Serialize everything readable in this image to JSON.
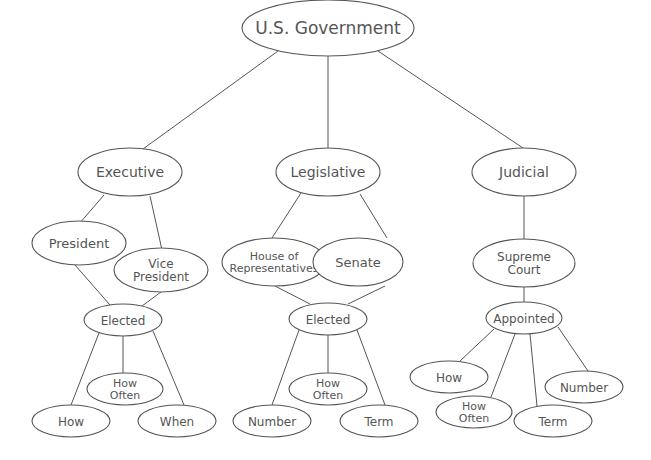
{
  "diagram": {
    "title": "U.S. Government",
    "colors": {
      "stroke": "#555555",
      "text": "#555555",
      "background": "#ffffff"
    },
    "nodes": [
      {
        "id": "gov",
        "lines": [
          "U.S. Government"
        ],
        "cx": 328,
        "cy": 28,
        "rx": 86,
        "ry": 28,
        "size": 17
      },
      {
        "id": "exec",
        "lines": [
          "Executive"
        ],
        "cx": 130,
        "cy": 172,
        "rx": 52,
        "ry": 24,
        "size": 14
      },
      {
        "id": "leg",
        "lines": [
          "Legislative"
        ],
        "cx": 328,
        "cy": 172,
        "rx": 52,
        "ry": 24,
        "size": 14
      },
      {
        "id": "jud",
        "lines": [
          "Judicial"
        ],
        "cx": 524,
        "cy": 172,
        "rx": 52,
        "ry": 24,
        "size": 14
      },
      {
        "id": "pres",
        "lines": [
          "President"
        ],
        "cx": 79,
        "cy": 243,
        "rx": 47,
        "ry": 22,
        "size": 13
      },
      {
        "id": "vp",
        "lines": [
          "Vice",
          "President"
        ],
        "cx": 161,
        "cy": 270,
        "rx": 47,
        "ry": 22,
        "size": 12
      },
      {
        "id": "exec_elected",
        "lines": [
          "Elected"
        ],
        "cx": 123,
        "cy": 320,
        "rx": 39,
        "ry": 16,
        "size": 12
      },
      {
        "id": "exec_howoften",
        "lines": [
          "How",
          "Often"
        ],
        "cx": 125,
        "cy": 389,
        "rx": 38,
        "ry": 16,
        "size": 11
      },
      {
        "id": "exec_how",
        "lines": [
          "How"
        ],
        "cx": 71,
        "cy": 421,
        "rx": 39,
        "ry": 16,
        "size": 12
      },
      {
        "id": "exec_when",
        "lines": [
          "When"
        ],
        "cx": 177,
        "cy": 421,
        "rx": 39,
        "ry": 16,
        "size": 12
      },
      {
        "id": "house",
        "lines": [
          "House of",
          "Representatives"
        ],
        "cx": 274,
        "cy": 262,
        "rx": 52,
        "ry": 24,
        "size": 11
      },
      {
        "id": "senate",
        "lines": [
          "Senate"
        ],
        "cx": 358,
        "cy": 262,
        "rx": 45,
        "ry": 24,
        "size": 13
      },
      {
        "id": "leg_elected",
        "lines": [
          "Elected"
        ],
        "cx": 328,
        "cy": 319,
        "rx": 39,
        "ry": 16,
        "size": 12
      },
      {
        "id": "leg_howoften",
        "lines": [
          "How",
          "Often"
        ],
        "cx": 328,
        "cy": 389,
        "rx": 39,
        "ry": 16,
        "size": 11
      },
      {
        "id": "leg_number",
        "lines": [
          "Number"
        ],
        "cx": 272,
        "cy": 421,
        "rx": 39,
        "ry": 16,
        "size": 12
      },
      {
        "id": "leg_term",
        "lines": [
          "Term"
        ],
        "cx": 379,
        "cy": 421,
        "rx": 39,
        "ry": 16,
        "size": 12
      },
      {
        "id": "court",
        "lines": [
          "Supreme",
          "Court"
        ],
        "cx": 524,
        "cy": 263,
        "rx": 51,
        "ry": 24,
        "size": 12
      },
      {
        "id": "jud_appointed",
        "lines": [
          "Appointed"
        ],
        "cx": 524,
        "cy": 318,
        "rx": 38,
        "ry": 16,
        "size": 12
      },
      {
        "id": "jud_how",
        "lines": [
          "How"
        ],
        "cx": 449,
        "cy": 377,
        "rx": 39,
        "ry": 16,
        "size": 12
      },
      {
        "id": "jud_howoften",
        "lines": [
          "How",
          "Often"
        ],
        "cx": 474,
        "cy": 412,
        "rx": 38,
        "ry": 16,
        "size": 11
      },
      {
        "id": "jud_term",
        "lines": [
          "Term"
        ],
        "cx": 553,
        "cy": 421,
        "rx": 39,
        "ry": 16,
        "size": 12
      },
      {
        "id": "jud_number",
        "lines": [
          "Number"
        ],
        "cx": 584,
        "cy": 387,
        "rx": 39,
        "ry": 16,
        "size": 12
      }
    ],
    "edges": [
      {
        "from": "gov",
        "to": "exec",
        "x1": 278,
        "y1": 51,
        "x2": 143,
        "y2": 149
      },
      {
        "from": "gov",
        "to": "leg",
        "x1": 328,
        "y1": 56,
        "x2": 328,
        "y2": 148
      },
      {
        "from": "gov",
        "to": "jud",
        "x1": 378,
        "y1": 51,
        "x2": 523,
        "y2": 148
      },
      {
        "from": "exec",
        "to": "pres",
        "x1": 104,
        "y1": 195,
        "x2": 79,
        "y2": 224
      },
      {
        "from": "exec",
        "to": "vp",
        "x1": 150,
        "y1": 196,
        "x2": 162,
        "y2": 250
      },
      {
        "from": "pres",
        "to": "exec_elected",
        "x1": 75,
        "y1": 265,
        "x2": 110,
        "y2": 305
      },
      {
        "from": "vp",
        "to": "exec_elected",
        "x1": 161,
        "y1": 292,
        "x2": 142,
        "y2": 306
      },
      {
        "from": "exec_elected",
        "to": "exec_how",
        "x1": 99,
        "y1": 333,
        "x2": 71,
        "y2": 405
      },
      {
        "from": "exec_elected",
        "to": "exec_howoften",
        "x1": 123,
        "y1": 336,
        "x2": 123,
        "y2": 373
      },
      {
        "from": "exec_elected",
        "to": "exec_when",
        "x1": 153,
        "y1": 331,
        "x2": 184,
        "y2": 405
      },
      {
        "from": "leg",
        "to": "house",
        "x1": 301,
        "y1": 193,
        "x2": 272,
        "y2": 238
      },
      {
        "from": "leg",
        "to": "senate",
        "x1": 360,
        "y1": 194,
        "x2": 387,
        "y2": 238
      },
      {
        "from": "house",
        "to": "leg_elected",
        "x1": 275,
        "y1": 286,
        "x2": 310,
        "y2": 304
      },
      {
        "from": "senate",
        "to": "leg_elected",
        "x1": 385,
        "y1": 286,
        "x2": 348,
        "y2": 304
      },
      {
        "from": "leg_elected",
        "to": "leg_number",
        "x1": 299,
        "y1": 330,
        "x2": 272,
        "y2": 405
      },
      {
        "from": "leg_elected",
        "to": "leg_howoften",
        "x1": 328,
        "y1": 335,
        "x2": 328,
        "y2": 373
      },
      {
        "from": "leg_elected",
        "to": "leg_term",
        "x1": 357,
        "y1": 330,
        "x2": 385,
        "y2": 405
      },
      {
        "from": "jud",
        "to": "court",
        "x1": 524,
        "y1": 196,
        "x2": 524,
        "y2": 239
      },
      {
        "from": "court",
        "to": "jud_appointed",
        "x1": 524,
        "y1": 287,
        "x2": 524,
        "y2": 302
      },
      {
        "from": "jud_appointed",
        "to": "jud_how",
        "x1": 494,
        "y1": 329,
        "x2": 460,
        "y2": 361
      },
      {
        "from": "jud_appointed",
        "to": "jud_howoften",
        "x1": 515,
        "y1": 334,
        "x2": 491,
        "y2": 397
      },
      {
        "from": "jud_appointed",
        "to": "jud_term",
        "x1": 530,
        "y1": 334,
        "x2": 537,
        "y2": 406
      },
      {
        "from": "jud_appointed",
        "to": "jud_number",
        "x1": 558,
        "y1": 327,
        "x2": 588,
        "y2": 371
      }
    ]
  }
}
